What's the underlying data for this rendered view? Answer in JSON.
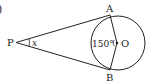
{
  "problem_label": ")",
  "diagram": {
    "points": {
      "P": "P",
      "A": "A",
      "B": "B",
      "O": "O"
    },
    "angle_label": "150°",
    "unknown_label": "x",
    "colors": {
      "stroke": "#222222",
      "background": "#ffffff"
    }
  }
}
